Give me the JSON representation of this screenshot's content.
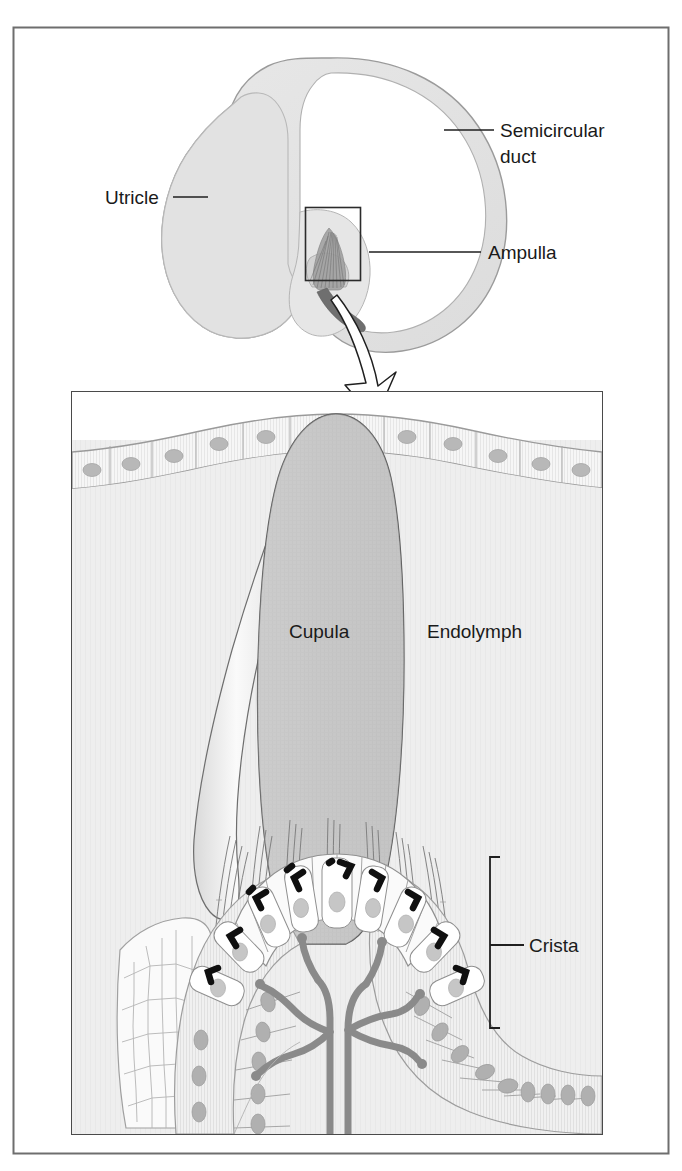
{
  "figure": {
    "outer_frame": {
      "stroke": "#6e6e6e"
    },
    "panels": [
      {
        "name": "overview-panel",
        "description": "Semicircular duct, utricle and ampulla overview"
      },
      {
        "name": "detail-panel",
        "description": "Magnified crista ampullaris with cupula"
      }
    ]
  },
  "labels": {
    "semicircular_duct_line1": "Semicircular",
    "semicircular_duct_line2": "duct",
    "utricle": "Utricle",
    "ampulla": "Ampulla",
    "cupula": "Cupula",
    "endolymph": "Endolymph",
    "crista": "Crista"
  },
  "icons": {
    "magnify_arrow": "curved-arrow-icon",
    "detail_box": "zoom-region-box-icon",
    "crista_bracket": "bracket-icon"
  },
  "colors": {
    "frame_stroke": "#6e6e6e",
    "outline": "#555555",
    "duct_fill": "#e4e4e4",
    "utricle_fill": "#e0e0e0",
    "endolymph_fill": "#efefef",
    "cupula_fill": "#c9c9c9",
    "cupula_light_fill": "#dedede",
    "epithelium_fill": "#f4f4f4",
    "hair_cell_fill": "#fbfbfb",
    "nucleus_fill": "#b6b6b6",
    "nerve_fill": "#8c8c8c",
    "kinocilium_fill": "#141414",
    "text": "#1a1a1a"
  },
  "structures": {
    "overview": [
      "semicircular duct ring",
      "utricle sac",
      "ampulla swelling",
      "crista with cupula"
    ],
    "detail": [
      "simple epithelium lining",
      "cupula gelatinous mass",
      "endolymph space",
      "stereocilia bundles",
      "hair cells with kinocilia",
      "supporting cells",
      "vestibular nerve branches",
      "polygonal cell mosaic"
    ]
  }
}
